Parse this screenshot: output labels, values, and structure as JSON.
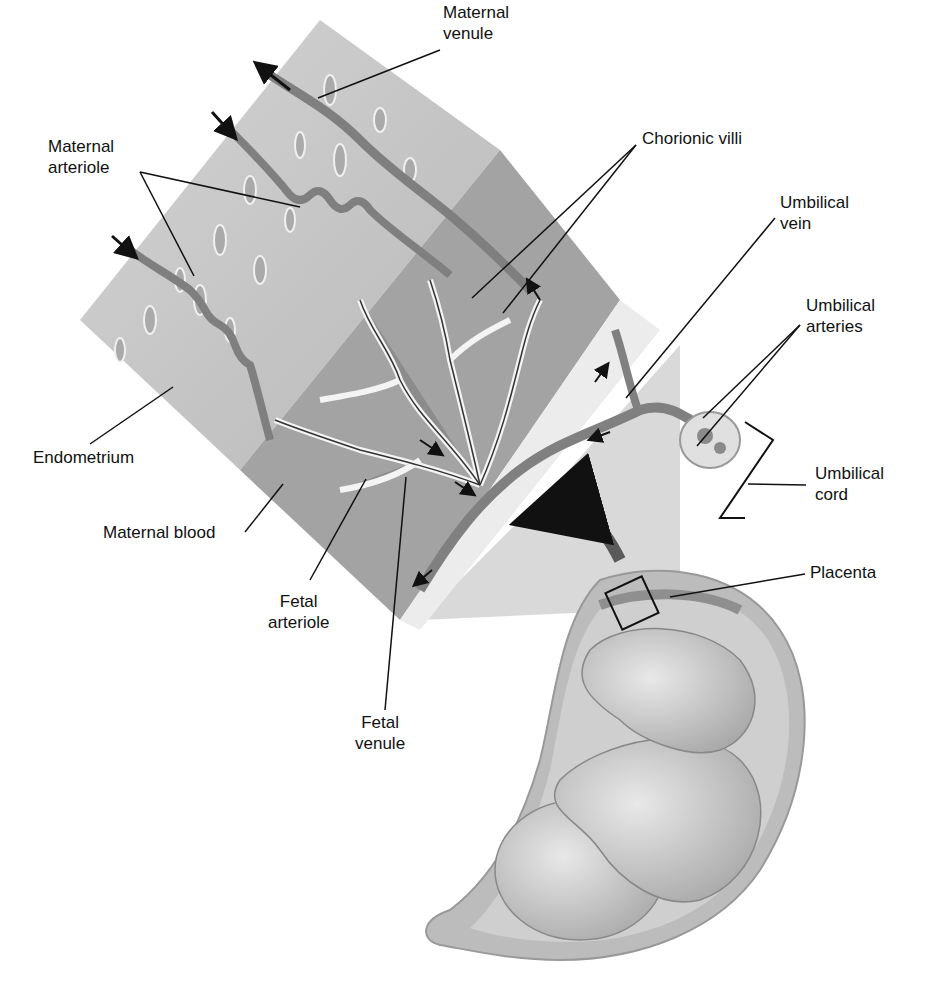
{
  "figure": {
    "colors": {
      "background": "#ffffff",
      "endometrium": "#c9c9c9",
      "maternal_blood": "#9e9e9e",
      "vessel": "#7d7d7d",
      "villi_outline": "#f2f2f2",
      "uterus": "#bdbdbd",
      "fetus": "#d6d6d6",
      "leader_line": "#111111"
    }
  },
  "labels": {
    "maternal_venule": "Maternal\nvenule",
    "maternal_arteriole": "Maternal\narteriole",
    "chorionic_villi": "Chorionic villi",
    "umbilical_vein": "Umbilical\nvein",
    "umbilical_arteries": "Umbilical\narteries",
    "umbilical_cord": "Umbilical\ncord",
    "endometrium": "Endometrium",
    "maternal_blood": "Maternal blood",
    "fetal_arteriole": "Fetal\narteriole",
    "fetal_venule": "Fetal\nvenule",
    "placenta": "Placenta"
  }
}
